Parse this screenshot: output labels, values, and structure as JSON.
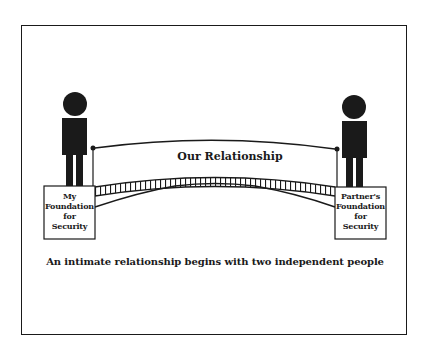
{
  "diagram": {
    "title": "Our Relationship",
    "caption": "An intimate relationship begins with two independent people",
    "left_person": {
      "box_lines": [
        "My",
        "Foundation",
        "for",
        "Security"
      ]
    },
    "right_person": {
      "box_lines": [
        "Partner's",
        "Foundation",
        "for",
        "Security"
      ]
    },
    "colors": {
      "ink": "#1a1a1a",
      "background": "#ffffff"
    }
  }
}
